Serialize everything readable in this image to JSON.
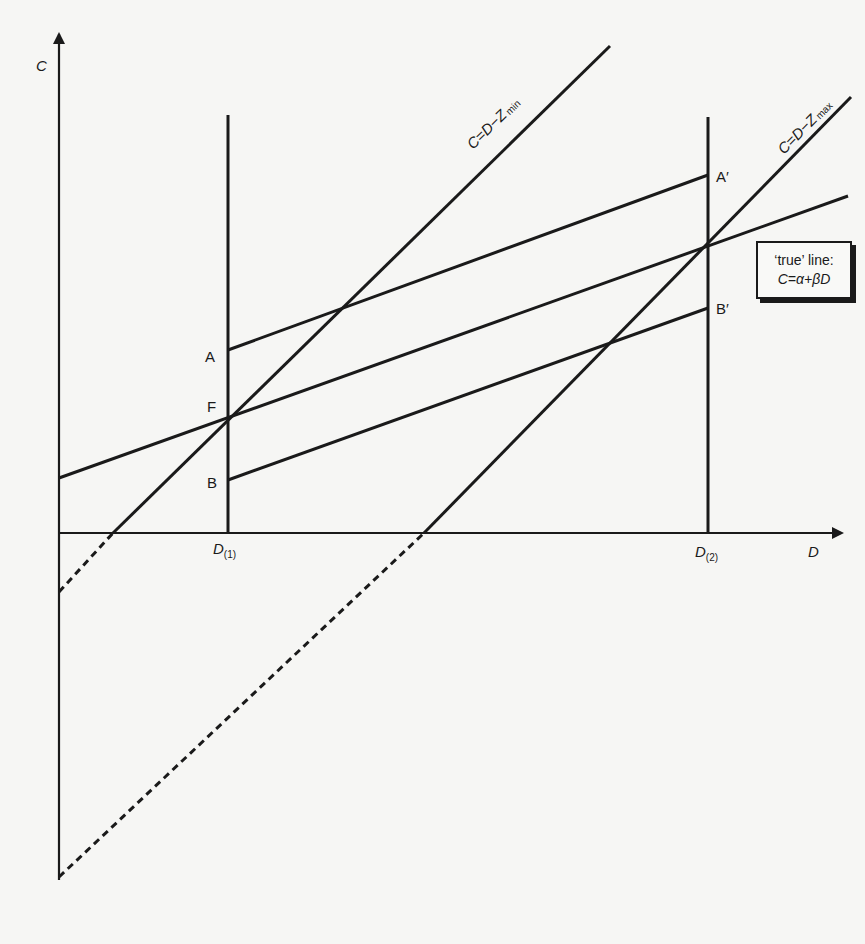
{
  "diagram": {
    "axes": {
      "y_label": "C",
      "x_label": "D"
    },
    "verticals": [
      {
        "id": "d1",
        "label_main": "D",
        "label_sub": "(1)"
      },
      {
        "id": "d2",
        "label_main": "D",
        "label_sub": "(2)"
      }
    ],
    "lines": {
      "zmin": {
        "label_main": "C=D−Z",
        "label_sub": "min"
      },
      "zmax": {
        "label_main": "C=D−Z",
        "label_sub": "max"
      },
      "true_line": {
        "description": "true line through F"
      },
      "upper_bound": {
        "start": "A",
        "end": "A′"
      },
      "lower_bound": {
        "start": "B",
        "end": "B′"
      }
    },
    "points": {
      "A": "A",
      "F": "F",
      "B": "B",
      "A_prime": "A′",
      "B_prime": "B′"
    },
    "legend": {
      "line1": "‘true’ line:",
      "line2": "C=α+βD"
    },
    "colors": {
      "ink": "#1a1a1a",
      "paper": "#f6f6f4"
    }
  }
}
